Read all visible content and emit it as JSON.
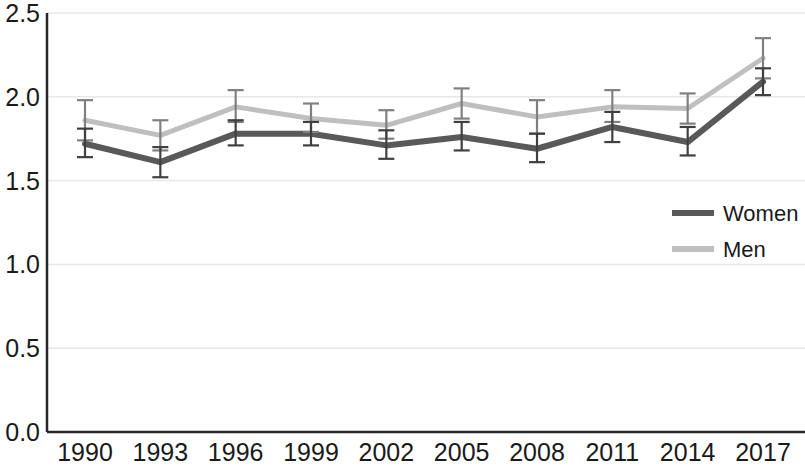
{
  "chart_data": {
    "type": "line",
    "title": "",
    "subtitle": "",
    "xlabel": "",
    "ylabel": "",
    "categories": [
      "1990",
      "1993",
      "1996",
      "1999",
      "2002",
      "2005",
      "2008",
      "2011",
      "2014",
      "2017"
    ],
    "x_tick_labels": [
      "1990",
      "1993",
      "1996",
      "1999",
      "2002",
      "2005",
      "2008",
      "2011",
      "2014",
      "2017"
    ],
    "y_tick_labels": [
      "0.0",
      "0.5",
      "1.0",
      "1.5",
      "2.0",
      "2.5"
    ],
    "y_tick_values": [
      0.0,
      0.5,
      1.0,
      1.5,
      2.0,
      2.5
    ],
    "ylim": [
      0.0,
      2.5
    ],
    "grid": "horizontal",
    "legend_position": "right-middle",
    "error_bars": true,
    "series": [
      {
        "name": "Women",
        "color": "#595959",
        "values": [
          1.72,
          1.61,
          1.78,
          1.78,
          1.71,
          1.76,
          1.69,
          1.82,
          1.73,
          2.09
        ],
        "err_low": [
          1.64,
          1.52,
          1.71,
          1.71,
          1.63,
          1.68,
          1.61,
          1.73,
          1.65,
          2.01
        ],
        "err_high": [
          1.81,
          1.7,
          1.86,
          1.85,
          1.8,
          1.85,
          1.78,
          1.91,
          1.82,
          2.17
        ]
      },
      {
        "name": "Men",
        "color": "#bfbfbf",
        "values": [
          1.86,
          1.77,
          1.94,
          1.87,
          1.83,
          1.96,
          1.88,
          1.94,
          1.93,
          2.23
        ],
        "err_low": [
          1.74,
          1.68,
          1.85,
          1.79,
          1.75,
          1.87,
          1.78,
          1.85,
          1.84,
          2.11
        ],
        "err_high": [
          1.98,
          1.86,
          2.04,
          1.96,
          1.92,
          2.05,
          1.98,
          2.04,
          2.02,
          2.35
        ]
      }
    ],
    "legend": [
      {
        "label": "Women",
        "color": "#595959"
      },
      {
        "label": "Men",
        "color": "#bfbfbf"
      }
    ],
    "colors": {
      "axis": "#262626",
      "gridline": "#e8e8e8",
      "women": "#595959",
      "men": "#bfbfbf",
      "errorbar_women": "#404040",
      "errorbar_men": "#808080",
      "background": "#ffffff",
      "text": "#1a1a1a"
    }
  }
}
